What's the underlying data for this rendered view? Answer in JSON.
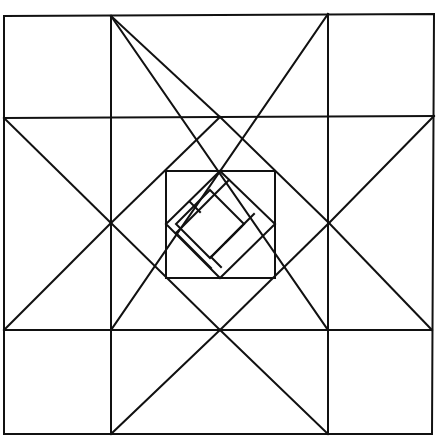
{
  "diagram": {
    "title": "",
    "stroke_color": "#111111",
    "background": "#ffffff",
    "stroke_width": 2,
    "outer_square": [
      [
        4,
        16
      ],
      [
        434,
        14
      ],
      [
        432,
        434
      ],
      [
        4,
        434
      ]
    ],
    "grid_lines": [
      {
        "name": "grid-vertical-left",
        "x1": 111,
        "y1": 16,
        "x2": 111,
        "y2": 434
      },
      {
        "name": "grid-vertical-right",
        "x1": 328,
        "y1": 14,
        "x2": 328,
        "y2": 434
      },
      {
        "name": "grid-horizontal-top",
        "x1": 4,
        "y1": 118,
        "x2": 434,
        "y2": 116
      },
      {
        "name": "grid-horizontal-bottom",
        "x1": 4,
        "y1": 330,
        "x2": 432,
        "y2": 330
      }
    ],
    "star_diagonals": [
      {
        "name": "diagonal-top-left-to-bottom",
        "x1": 111,
        "y1": 16,
        "x2": 328,
        "y2": 330
      },
      {
        "name": "diagonal-top-right-to-bottom",
        "x1": 328,
        "y1": 14,
        "x2": 111,
        "y2": 330
      },
      {
        "name": "diagonal-left-top",
        "x1": 4,
        "y1": 118,
        "x2": 111,
        "y2": 223
      },
      {
        "name": "diagonal-left-bottom",
        "x1": 111,
        "y1": 223,
        "x2": 4,
        "y2": 330
      },
      {
        "name": "diagonal-right-top",
        "x1": 434,
        "y1": 116,
        "x2": 329,
        "y2": 223
      },
      {
        "name": "diagonal-right-bottom",
        "x1": 329,
        "y1": 223,
        "x2": 432,
        "y2": 330
      },
      {
        "name": "diagonal-top-arm-left",
        "x1": 111,
        "y1": 16,
        "x2": 220,
        "y2": 117
      },
      {
        "name": "diagonal-bottom-arm-left",
        "x1": 111,
        "y1": 434,
        "x2": 220,
        "y2": 330
      },
      {
        "name": "diagonal-bottom-arm-right",
        "x1": 328,
        "y1": 434,
        "x2": 220,
        "y2": 330
      },
      {
        "name": "diagonal-center-diamond-tl",
        "x1": 220,
        "y1": 117,
        "x2": 111,
        "y2": 223
      },
      {
        "name": "diagonal-center-diamond-tr",
        "x1": 220,
        "y1": 117,
        "x2": 329,
        "y2": 223
      },
      {
        "name": "diagonal-center-diamond-bl",
        "x1": 111,
        "y1": 223,
        "x2": 220,
        "y2": 330
      },
      {
        "name": "diagonal-center-diamond-br",
        "x1": 329,
        "y1": 223,
        "x2": 220,
        "y2": 330
      }
    ],
    "center_square": [
      [
        166,
        171
      ],
      [
        275,
        171
      ],
      [
        275,
        278
      ],
      [
        166,
        278
      ]
    ],
    "center_diamond": [
      [
        220,
        171
      ],
      [
        275,
        224
      ],
      [
        220,
        278
      ],
      [
        166,
        224
      ]
    ],
    "inner_diamond": [
      [
        210,
        190
      ],
      [
        244,
        224
      ],
      [
        210,
        258
      ],
      [
        176,
        224
      ]
    ],
    "band_lines": [
      {
        "name": "band-line-upper",
        "x1": 229,
        "y1": 180,
        "x2": 176,
        "y2": 233
      },
      {
        "name": "band-line-upper-inner",
        "x1": 190,
        "y1": 202,
        "x2": 200,
        "y2": 212
      },
      {
        "name": "band-line-right",
        "x1": 254,
        "y1": 214,
        "x2": 211,
        "y2": 257
      },
      {
        "name": "band-line-right-inner",
        "x1": 241,
        "y1": 227,
        "x2": 226,
        "y2": 242
      },
      {
        "name": "band-line-lower",
        "x1": 211,
        "y1": 257,
        "x2": 221,
        "y2": 267
      },
      {
        "name": "band-line-left",
        "x1": 176,
        "y1": 233,
        "x2": 211,
        "y2": 268
      }
    ]
  }
}
